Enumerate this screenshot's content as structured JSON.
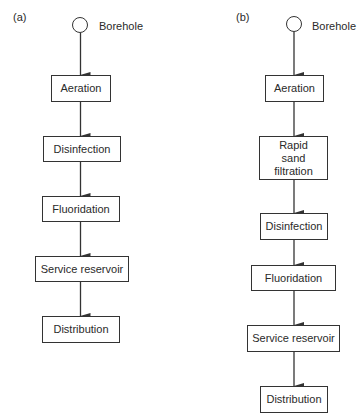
{
  "diagram_a": {
    "label": "(a)",
    "source": "Borehole",
    "steps": [
      "Aeration",
      "Disinfection",
      "Fluoridation",
      "Service reservoir",
      "Distribution"
    ]
  },
  "diagram_b": {
    "label": "(b)",
    "source": "Borehole",
    "steps": [
      "Aeration",
      "Rapid sand filtration",
      "Disinfection",
      "Fluoridation",
      "Service reservoir",
      "Distribution"
    ]
  },
  "colors": {
    "line": "#333333",
    "text": "#2a2a2a",
    "background": "#ffffff"
  }
}
